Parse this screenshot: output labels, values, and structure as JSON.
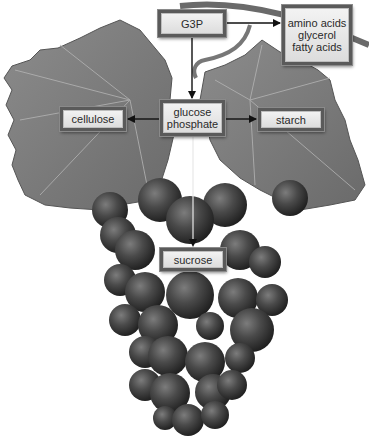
{
  "diagram": {
    "title": "",
    "background_image": {
      "subject": "grape cluster with grape leaves and vine tendril",
      "color_mode": "grayscale"
    },
    "nodes": {
      "g3p": {
        "label": "G3P"
      },
      "lipids_aa": {
        "lines": [
          "amino acids",
          "glycerol",
          "fatty acids"
        ]
      },
      "glucose_phosphate": {
        "lines": [
          "glucose",
          "phosphate"
        ]
      },
      "cellulose": {
        "label": "cellulose"
      },
      "starch": {
        "label": "starch"
      },
      "sucrose": {
        "label": "sucrose"
      }
    },
    "edges": [
      {
        "from": "G3P",
        "to": "amino acids / glycerol / fatty acids"
      },
      {
        "from": "G3P",
        "to": "glucose phosphate"
      },
      {
        "from": "glucose phosphate",
        "to": "cellulose"
      },
      {
        "from": "glucose phosphate",
        "to": "starch"
      },
      {
        "from": "glucose phosphate",
        "to": "sucrose"
      }
    ],
    "colors": {
      "box_fill": "#e8e8e8",
      "box_border": "#5a5a5a",
      "arrow": "#111111",
      "leaf": "#7a7a7a",
      "grape": "#3a3a3a"
    }
  }
}
